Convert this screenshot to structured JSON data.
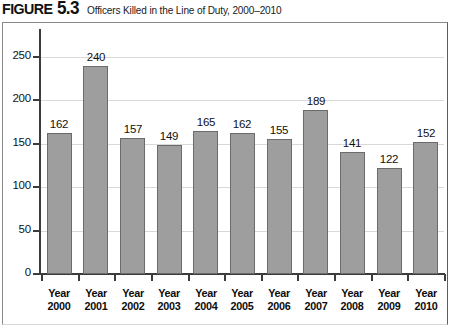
{
  "figure": {
    "label_word": "FIGURE",
    "label_number": "5.3",
    "caption": "Officers Killed in the Line of Duty, 2000–2010"
  },
  "colors": {
    "bar_fill": "#9e9e9e",
    "bar_stroke": "#6b6b6b",
    "gridline": "#d9d9d9",
    "axis": "#3c3c3c",
    "frame": "#8a8a8a",
    "text": "#111111",
    "background": "#ffffff"
  },
  "chart_data": {
    "type": "bar",
    "title": "Officers Killed in the Line of Duty, 2000–2010",
    "xlabel": "",
    "ylabel": "",
    "categories": [
      "Year 2000",
      "Year 2001",
      "Year 2002",
      "Year 2003",
      "Year 2004",
      "Year 2005",
      "Year 2006",
      "Year 2007",
      "Year 2008",
      "Year 2009",
      "Year 2010"
    ],
    "category_lines": [
      [
        "Year",
        "2000"
      ],
      [
        "Year",
        "2001"
      ],
      [
        "Year",
        "2002"
      ],
      [
        "Year",
        "2003"
      ],
      [
        "Year",
        "2004"
      ],
      [
        "Year",
        "2005"
      ],
      [
        "Year",
        "2006"
      ],
      [
        "Year",
        "2007"
      ],
      [
        "Year",
        "2008"
      ],
      [
        "Year",
        "2009"
      ],
      [
        "Year",
        "2010"
      ]
    ],
    "values": [
      162,
      240,
      157,
      149,
      165,
      162,
      155,
      189,
      141,
      122,
      152
    ],
    "data_labels": [
      "162",
      "240",
      "157",
      "149",
      "165",
      "162",
      "155",
      "189",
      "141",
      "122",
      "152"
    ],
    "ylim": [
      0,
      250
    ],
    "yticks": [
      0,
      50,
      100,
      150,
      200,
      250
    ],
    "ytick_labels": [
      "0",
      "50",
      "100",
      "150",
      "200",
      "250"
    ],
    "grid": true,
    "grid_axis": "y",
    "legend": false,
    "legend_position": "none"
  }
}
